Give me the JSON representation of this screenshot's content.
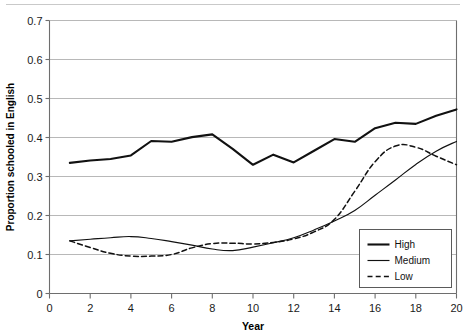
{
  "figure": {
    "name": "proportion-schooled-in-english-line-chart",
    "background": "#ffffff",
    "line_color": "#111111",
    "grid_color": "#a6a6a6",
    "axis_color": "#6e6e6e"
  },
  "axes": {
    "x_title": "Year",
    "y_title": "Proportion schooled in English",
    "x_ticks": [
      "0",
      "2",
      "4",
      "6",
      "8",
      "10",
      "12",
      "14",
      "16",
      "18",
      "20"
    ],
    "y_ticks": [
      "0",
      "0.1",
      "0.2",
      "0.3",
      "0.4",
      "0.5",
      "0.6",
      "0.7"
    ]
  },
  "legend": {
    "items": [
      {
        "label": "High",
        "style": "thick-solid"
      },
      {
        "label": "Medium",
        "style": "thin-solid"
      },
      {
        "label": "Low",
        "style": "dashed"
      }
    ]
  },
  "chart_data": {
    "type": "line",
    "title": "",
    "xlabel": "Year",
    "ylabel": "Proportion schooled in English",
    "xlim": [
      0,
      20
    ],
    "ylim": [
      0,
      0.7
    ],
    "xticks": [
      0,
      2,
      4,
      6,
      8,
      10,
      12,
      14,
      16,
      18,
      20
    ],
    "yticks": [
      0,
      0.1,
      0.2,
      0.3,
      0.4,
      0.5,
      0.6,
      0.7
    ],
    "grid": "horizontal",
    "legend_position": "bottom-right",
    "x": [
      1,
      2,
      3,
      4,
      5,
      6,
      7,
      8,
      9,
      10,
      11,
      12,
      13,
      14,
      15,
      16,
      17,
      18,
      19,
      20
    ],
    "series": [
      {
        "name": "High",
        "style": "thick-solid",
        "values": [
          0.335,
          0.341,
          0.345,
          0.354,
          0.391,
          0.389,
          0.401,
          0.408,
          0.371,
          0.33,
          0.356,
          0.336,
          0.366,
          0.396,
          0.389,
          0.424,
          0.438,
          0.435,
          0.456,
          0.472
        ]
      },
      {
        "name": "Medium",
        "style": "thin-solid",
        "values": [
          0.135,
          0.139,
          0.143,
          0.146,
          0.141,
          0.133,
          0.124,
          0.114,
          0.11,
          0.119,
          0.13,
          0.143,
          0.163,
          0.186,
          0.213,
          0.252,
          0.291,
          0.331,
          0.365,
          0.39
        ]
      },
      {
        "name": "Low",
        "style": "dashed",
        "values": [
          0.135,
          0.118,
          0.103,
          0.096,
          0.096,
          0.1,
          0.117,
          0.128,
          0.129,
          0.127,
          0.131,
          0.14,
          0.158,
          0.19,
          0.262,
          0.338,
          0.378,
          0.375,
          0.352,
          0.33
        ]
      }
    ]
  }
}
